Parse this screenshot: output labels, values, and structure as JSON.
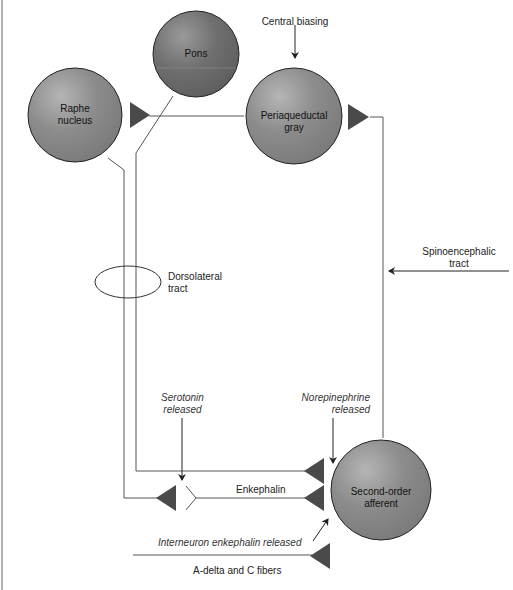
{
  "nodes": {
    "pons": "Pons",
    "raphe_line1": "Raphe",
    "raphe_line2": "nucleus",
    "pag_line1": "Periaqueductal",
    "pag_line2": "gray",
    "second_line1": "Second-order",
    "second_line2": "afferent"
  },
  "labels": {
    "central_biasing": "Central biasing",
    "dorsolateral_line1": "Dorsolateral",
    "dorsolateral_line2": "tract",
    "spino_line1": "Spinoencephalic",
    "spino_line2": "tract",
    "serotonin_line1": "Serotonin",
    "serotonin_line2": "released",
    "norepi_line1": "Norepinephrine",
    "norepi_line2": "released",
    "enkephalin": "Enkephalin",
    "interneuron": "Interneuron enkephalin released",
    "fibers": "A-delta and C fibers"
  },
  "colors": {
    "node_fill": "#8a8a8a",
    "node_dark": "#6e6e6e",
    "synapse": "#4a4a4a",
    "line": "#555555"
  }
}
